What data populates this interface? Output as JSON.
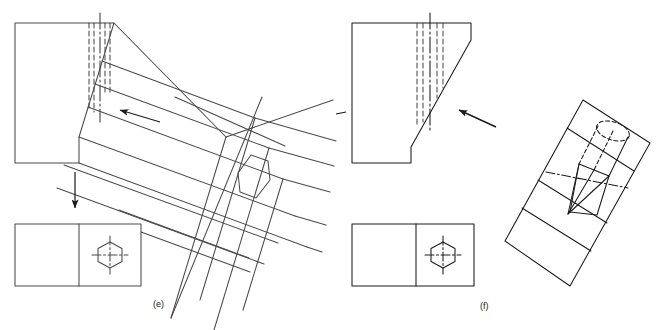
{
  "figure": {
    "background_color": "#ffffff",
    "line_color": "#3a3a3a",
    "dark_line_color": "#1a1a1a",
    "captions": [
      {
        "name": "caption-e",
        "label": "(e)",
        "x": 199,
        "y": 303
      },
      {
        "name": "caption-f",
        "label": "(f)",
        "x": 483,
        "y": 305
      }
    ]
  },
  "panel_e": {
    "name": "panel-e",
    "label": "(e)",
    "front_view": {
      "name": "front-view-e",
      "description": "front elevation with chamfered corner and hidden hexagon edges",
      "outline": "15,23 114,23 79,137 79,163 15,163",
      "hidden_lines_count": 5,
      "center_line_label": "centre-line"
    },
    "plan_view": {
      "name": "plan-view-e",
      "description": "plan view: rectangle split by vertical divider, hexagon with crossed centre lines",
      "rect": {
        "x": 15,
        "y": 224,
        "w": 126,
        "h": 62
      },
      "divider_x": 79,
      "hexagon_center": {
        "x": 110,
        "y": 255
      },
      "hexagon_radius": 13
    },
    "isometric_view": {
      "name": "isometric-view-e",
      "description": "isometric pictorial of inclined ribbed face with hexagonal recess",
      "hexagon_label": "hexagonal-recess"
    },
    "arrows": [
      {
        "name": "direction-arrow-left",
        "label": "view direction left",
        "x1": 160,
        "y1": 122,
        "x2": 120,
        "y2": 110
      },
      {
        "name": "projection-arrow-down",
        "label": "projection down",
        "x1": 75,
        "y1": 172,
        "x2": 75,
        "y2": 208
      }
    ]
  },
  "panel_f": {
    "name": "panel-f",
    "label": "(f)",
    "front_view": {
      "name": "front-view-f",
      "description": "front elevation with steeper chamfer and hidden hexagon edges",
      "outline": "352,23 471,23 471,40 411,147 411,163 352,163",
      "hidden_lines_count": 5
    },
    "plan_view": {
      "name": "plan-view-f",
      "description": "plan view: rectangle split by vertical divider, hexagon with crossed centre lines",
      "rect": {
        "x": 352,
        "y": 224,
        "w": 122,
        "h": 62
      },
      "divider_x": 416,
      "hexagon_center": {
        "x": 443,
        "y": 255
      },
      "hexagon_radius": 13
    },
    "isometric_view": {
      "name": "isometric-view-f",
      "description": "rotated rectangular prism with pointed hexagonal drill-like form, part hidden",
      "feature_label": "pointed-hexagonal-prism"
    },
    "arrows": [
      {
        "name": "direction-arrow-upleft",
        "label": "view direction up-left",
        "x1": 496,
        "y1": 127,
        "x2": 459,
        "y2": 110
      }
    ]
  }
}
